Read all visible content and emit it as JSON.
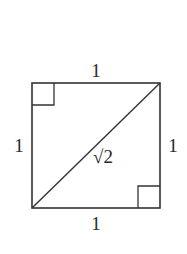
{
  "diagram": {
    "stroke_color": "#333333",
    "square": {
      "top_left": [
        32,
        83
      ],
      "top_right": [
        160,
        83
      ],
      "bottom_right": [
        160,
        208
      ],
      "bottom_left": [
        32,
        208
      ]
    },
    "diagonal": {
      "from": [
        32,
        208
      ],
      "to": [
        160,
        83
      ],
      "label": "√2"
    },
    "right_angle_markers": [
      {
        "corner": "top-left",
        "size": 22
      },
      {
        "corner": "bottom-right",
        "size": 22
      }
    ],
    "side_labels": {
      "top": "1",
      "bottom": "1",
      "left": "1",
      "right": "1"
    }
  }
}
